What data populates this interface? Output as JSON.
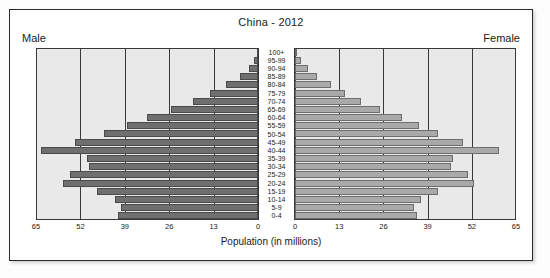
{
  "chart": {
    "title": "China - 2012",
    "male_label": "Male",
    "female_label": "Female",
    "xaxis_title": "Population (in millions)"
  },
  "chart_data": {
    "type": "bar",
    "subtype": "population-pyramid",
    "title": "China - 2012",
    "xlabel": "Population (in millions)",
    "ylabel": "",
    "xlim": [
      0,
      65
    ],
    "xticks": [
      65,
      52,
      39,
      26,
      13,
      0,
      0,
      13,
      26,
      39,
      52,
      65
    ],
    "grid": true,
    "legend": [
      "Male",
      "Female"
    ],
    "legend_position": "top-corners",
    "categories": [
      "100+",
      "95-99",
      "90-94",
      "85-89",
      "80-84",
      "75-79",
      "70-74",
      "65-69",
      "60-64",
      "55-59",
      "50-54",
      "45-49",
      "40-44",
      "35-39",
      "30-34",
      "25-29",
      "20-24",
      "15-19",
      "10-14",
      "5-9",
      "0-4"
    ],
    "series": [
      {
        "name": "Male",
        "values": [
          0.3,
          1.2,
          2.6,
          5.4,
          9.4,
          14.0,
          19.0,
          25.5,
          32.5,
          38.5,
          45.0,
          53.5,
          63.5,
          50.0,
          49.5,
          55.0,
          57.0,
          47.0,
          42.0,
          40.0,
          41.0
        ]
      },
      {
        "name": "Female",
        "values": [
          0.6,
          1.9,
          3.7,
          6.6,
          10.6,
          14.8,
          19.3,
          25.0,
          31.5,
          36.5,
          42.0,
          49.5,
          60.0,
          46.5,
          46.0,
          51.0,
          52.5,
          42.0,
          37.0,
          35.0,
          36.0
        ]
      }
    ]
  }
}
